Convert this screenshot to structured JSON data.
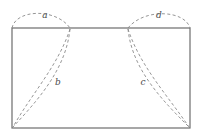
{
  "figure": {
    "background_color": "#ffffff",
    "rectangle": {
      "name": "bounding-rectangle",
      "stroke_color": "#6d6d6d",
      "stroke_width": 1.2,
      "x": 12,
      "y": 28,
      "width": 178,
      "height": 100
    },
    "dash_pattern": "3 2.4",
    "curve_stroke_color": "#8a8a8a",
    "curve_stroke_width": 0.9,
    "arcs": [
      {
        "name": "arc-a",
        "label": "a",
        "label_x": 45,
        "label_y": 15,
        "path": "M 12 28 C 16 9 56 8 70 28"
      },
      {
        "name": "arc-d",
        "label": "d",
        "label_x": 159,
        "label_y": 15,
        "path": "M 128 28 C 144 8 185 10 190 28"
      }
    ],
    "curves": [
      {
        "name": "curve-b-outer",
        "path": "M 70 29 C 58 66 30 96 13 127"
      },
      {
        "name": "curve-b-inner",
        "path": "M 70 29 C 66 70 36 102 13 127"
      },
      {
        "name": "curve-c-outer",
        "path": "M 128 29 C 140 66 168 96 189 127"
      },
      {
        "name": "curve-c-inner",
        "path": "M 128 29 C 132 70 164 102 189 127"
      }
    ],
    "curve_labels": [
      {
        "name": "label-b",
        "label": "b",
        "label_x": 58,
        "label_y": 82
      },
      {
        "name": "label-c",
        "label": "c",
        "label_x": 143,
        "label_y": 82
      }
    ]
  }
}
